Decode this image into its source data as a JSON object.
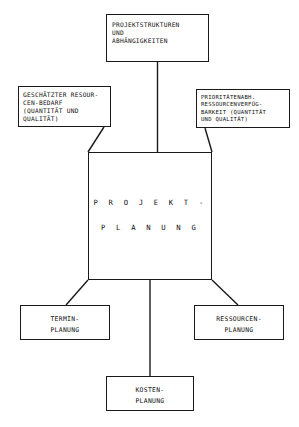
{
  "diagram": {
    "stroke_color": "#1a1a1a",
    "background_color": "#ffffff",
    "center": {
      "line1": "P R O J E K T -",
      "line2": "P L A N U N G"
    },
    "inputs": {
      "top": "PROJEKTSTRUKTUREN\nUND\nABHÄNGIGKEITEN",
      "left": "GESCHÄTZTER RESOUR-\nCEN-BEDARF\n(QUANTITÄT UND\nQUALITÄT)",
      "right": "PRIORITÄTENABH.\nRESSOURCENVERFÜG-\nBARKEIT (QUANTITÄT\nUND QUALITÄT)"
    },
    "outputs": {
      "termin": {
        "line1": "TERMIN-",
        "line2": "PLANUNG"
      },
      "ressourcen": {
        "line1": "RESSOURCEN-",
        "line2": "PLANUNG"
      },
      "kosten": {
        "line1": "KOSTEN-",
        "line2": "PLANUNG"
      }
    }
  }
}
